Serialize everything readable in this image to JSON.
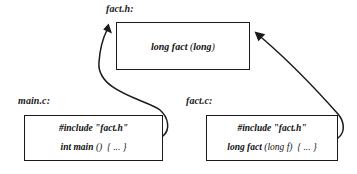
{
  "diagram": {
    "background_color": "#ffffff",
    "line_color": "#1a1a1a",
    "files": {
      "header": {
        "label": "fact.h:",
        "box": {
          "lines": [
            {
              "prefix": "long fact ",
              "paren_open": "(",
              "inner": "long",
              "paren_close": ")"
            }
          ],
          "line_text": "long fact (long)"
        }
      },
      "main": {
        "label": "main.c:",
        "box": {
          "line1": "#include \"fact.h\"",
          "line2_prefix": "int main ",
          "line2_parens": "()",
          "line2_body": "{ ... }",
          "line2_text": "int main () { ... }"
        }
      },
      "source": {
        "label": "fact.c:",
        "box": {
          "line1": "#include \"fact.h\"",
          "line2_prefix": "long fact ",
          "line2_parens": "(long f)",
          "line2_body": "{ ... }",
          "line2_text": "long fact (long f) { ... }"
        }
      }
    },
    "arrows": [
      {
        "name": "main-to-header",
        "from": "main.c",
        "to": "fact.h",
        "style": "curved-s"
      },
      {
        "name": "source-to-header",
        "from": "fact.c",
        "to": "fact.h",
        "style": "curved-s"
      }
    ]
  }
}
